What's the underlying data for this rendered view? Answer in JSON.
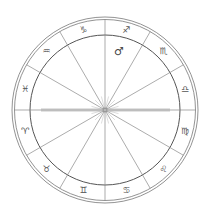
{
  "chart": {
    "center": [
      105,
      110
    ],
    "outer_radius": 93,
    "outer_inner_radius": 90.5,
    "zodiac_inner_radius": 75,
    "line_color": "#888888",
    "ring_color": "#777777",
    "axis_color": "#9a9a9a"
  },
  "signs": [
    {
      "name": "Libra",
      "glyph": "♎",
      "angle": 15
    },
    {
      "name": "Scorpio",
      "glyph": "♏",
      "angle": 45
    },
    {
      "name": "Sagittarius",
      "glyph": "♐",
      "angle": 75
    },
    {
      "name": "Capricorn",
      "glyph": "♑",
      "angle": 105
    },
    {
      "name": "Aquarius",
      "glyph": "♒",
      "angle": 135
    },
    {
      "name": "Pisces",
      "glyph": "♓",
      "angle": 165
    },
    {
      "name": "Aries",
      "glyph": "♈",
      "angle": 195
    },
    {
      "name": "Taurus",
      "glyph": "♉",
      "angle": 225
    },
    {
      "name": "Gemini",
      "glyph": "♊",
      "angle": 255
    },
    {
      "name": "Cancer",
      "glyph": "♋",
      "angle": 285
    },
    {
      "name": "Leo",
      "glyph": "♌",
      "angle": 315
    },
    {
      "name": "Virgo",
      "glyph": "♍",
      "angle": 345
    }
  ],
  "planets": [
    {
      "name": "Mars",
      "glyph": "♂",
      "x": 119,
      "y": 51
    }
  ]
}
